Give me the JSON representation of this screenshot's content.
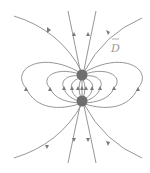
{
  "diagram": {
    "label": "D",
    "label_has_vector_bar": true,
    "charges": [
      {
        "name": "upper-charge",
        "x": 82,
        "y": 75,
        "r": 5.5
      },
      {
        "name": "lower-charge",
        "x": 82,
        "y": 101,
        "r": 5.5
      }
    ],
    "colors": {
      "line": "#8a8a8a",
      "charge": "#6e6e6e",
      "label": "#9a9a9a",
      "background": "#ffffff"
    }
  }
}
